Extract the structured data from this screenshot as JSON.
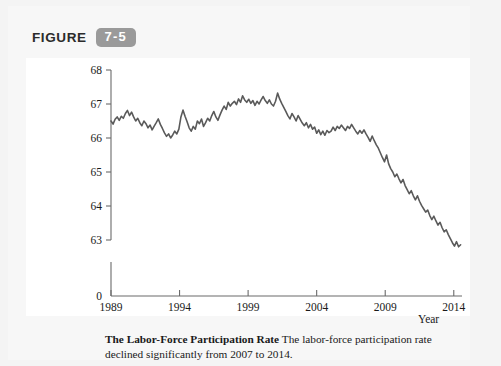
{
  "figure": {
    "label_word": "FIGURE",
    "badge": "7-5"
  },
  "caption": {
    "title": "The Labor-Force Participation Rate",
    "body": "The labor-force participation rate declined significantly from 2007 to 2014."
  },
  "colors": {
    "line": "#5a5a5a",
    "axis": "#6b6b6b",
    "badge_bg": "#9a9a9a",
    "page_bg": "#f4f4f4",
    "chart_bg": "#ffffff",
    "text": "#1a1a1a"
  },
  "chart_data": {
    "type": "line",
    "title": "The Labor-Force Participation Rate",
    "xlabel": "Year",
    "ylabel": "Percent",
    "xlim": [
      1989,
      2014.6
    ],
    "ylim": [
      62.4,
      68
    ],
    "y_axis_break": true,
    "y_break_label": "0",
    "grid": false,
    "legend": null,
    "xticks": [
      1989,
      1994,
      1999,
      2004,
      2009,
      2014
    ],
    "xtick_labels": [
      "1989",
      "1994",
      "1999",
      "2004",
      "2009",
      "2014"
    ],
    "yticks": [
      63,
      64,
      65,
      66,
      67,
      68
    ],
    "ytick_labels": [
      "63",
      "64",
      "65",
      "66",
      "67",
      "68"
    ],
    "series": [
      {
        "name": "Labor-force participation rate",
        "x": [
          1989.0,
          1989.15,
          1989.3,
          1989.45,
          1989.6,
          1989.75,
          1989.9,
          1990.05,
          1990.2,
          1990.35,
          1990.5,
          1990.65,
          1990.8,
          1990.95,
          1991.1,
          1991.25,
          1991.4,
          1991.55,
          1991.7,
          1991.85,
          1992.0,
          1992.15,
          1992.3,
          1992.45,
          1992.6,
          1992.75,
          1992.9,
          1993.05,
          1993.2,
          1993.35,
          1993.5,
          1993.65,
          1993.8,
          1993.95,
          1994.1,
          1994.25,
          1994.4,
          1994.55,
          1994.7,
          1994.85,
          1995.0,
          1995.15,
          1995.3,
          1995.45,
          1995.6,
          1995.75,
          1995.9,
          1996.05,
          1996.2,
          1996.35,
          1996.5,
          1996.65,
          1996.8,
          1996.95,
          1997.1,
          1997.25,
          1997.4,
          1997.55,
          1997.7,
          1997.85,
          1998.0,
          1998.15,
          1998.3,
          1998.45,
          1998.6,
          1998.75,
          1998.9,
          1999.05,
          1999.2,
          1999.35,
          1999.5,
          1999.65,
          1999.8,
          1999.95,
          2000.1,
          2000.25,
          2000.4,
          2000.55,
          2000.7,
          2000.85,
          2001.0,
          2001.15,
          2001.3,
          2001.45,
          2001.6,
          2001.75,
          2001.9,
          2002.05,
          2002.2,
          2002.35,
          2002.5,
          2002.65,
          2002.8,
          2002.95,
          2003.1,
          2003.25,
          2003.4,
          2003.55,
          2003.7,
          2003.85,
          2004.0,
          2004.15,
          2004.3,
          2004.45,
          2004.6,
          2004.75,
          2004.9,
          2005.05,
          2005.2,
          2005.35,
          2005.5,
          2005.65,
          2005.8,
          2005.95,
          2006.1,
          2006.25,
          2006.4,
          2006.55,
          2006.7,
          2006.85,
          2007.0,
          2007.15,
          2007.3,
          2007.45,
          2007.6,
          2007.75,
          2007.9,
          2008.05,
          2008.2,
          2008.35,
          2008.5,
          2008.65,
          2008.8,
          2008.95,
          2009.1,
          2009.25,
          2009.4,
          2009.55,
          2009.7,
          2009.85,
          2010.0,
          2010.15,
          2010.3,
          2010.45,
          2010.6,
          2010.75,
          2010.9,
          2011.05,
          2011.2,
          2011.35,
          2011.5,
          2011.65,
          2011.8,
          2011.95,
          2012.1,
          2012.25,
          2012.4,
          2012.55,
          2012.7,
          2012.85,
          2013.0,
          2013.15,
          2013.3,
          2013.45,
          2013.6,
          2013.75,
          2013.9,
          2014.05,
          2014.2,
          2014.35,
          2014.5
        ],
        "y": [
          66.5,
          66.41,
          66.55,
          66.62,
          66.52,
          66.64,
          66.58,
          66.72,
          66.81,
          66.66,
          66.76,
          66.62,
          66.5,
          66.58,
          66.45,
          66.36,
          66.5,
          66.42,
          66.3,
          66.38,
          66.24,
          66.35,
          66.45,
          66.56,
          66.4,
          66.28,
          66.15,
          66.05,
          66.12,
          66.0,
          66.09,
          66.2,
          66.12,
          66.26,
          66.62,
          66.82,
          66.64,
          66.48,
          66.3,
          66.2,
          66.34,
          66.26,
          66.5,
          66.42,
          66.56,
          66.34,
          66.45,
          66.58,
          66.5,
          66.66,
          66.78,
          66.62,
          66.52,
          66.68,
          66.82,
          66.94,
          66.84,
          67.05,
          66.94,
          67.02,
          67.08,
          66.98,
          67.15,
          67.05,
          67.24,
          67.12,
          67.05,
          67.14,
          67.02,
          67.1,
          66.96,
          67.08,
          67.0,
          67.12,
          67.22,
          67.1,
          67.02,
          67.12,
          67.0,
          66.94,
          67.08,
          67.32,
          67.15,
          67.02,
          66.9,
          66.78,
          66.66,
          66.56,
          66.72,
          66.62,
          66.5,
          66.66,
          66.55,
          66.44,
          66.36,
          66.45,
          66.3,
          66.4,
          66.26,
          66.32,
          66.14,
          66.24,
          66.1,
          66.2,
          66.08,
          66.22,
          66.16,
          66.2,
          66.32,
          66.22,
          66.34,
          66.28,
          66.38,
          66.3,
          66.22,
          66.34,
          66.28,
          66.4,
          66.3,
          66.2,
          66.12,
          66.22,
          66.14,
          66.24,
          66.12,
          66.02,
          65.9,
          66.06,
          65.92,
          65.8,
          65.7,
          65.56,
          65.42,
          65.3,
          65.5,
          65.24,
          65.1,
          65.0,
          64.86,
          64.94,
          64.8,
          64.68,
          64.78,
          64.6,
          64.48,
          64.36,
          64.45,
          64.3,
          64.18,
          64.3,
          64.14,
          64.02,
          63.92,
          63.82,
          63.88,
          63.72,
          63.6,
          63.7,
          63.56,
          63.44,
          63.52,
          63.36,
          63.24,
          63.3,
          63.16,
          63.04,
          62.92,
          62.82,
          62.95,
          62.8,
          62.86
        ]
      }
    ]
  }
}
